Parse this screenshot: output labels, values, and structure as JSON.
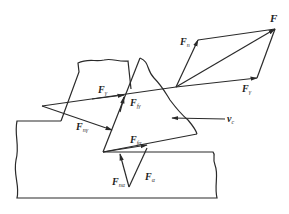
{
  "diagram": {
    "type": "cutting-force-diagram",
    "labels": {
      "F": "F",
      "F_n": {
        "main": "F",
        "sub": "n"
      },
      "F_gamma_right": {
        "main": "F",
        "sub": "γ"
      },
      "F_gamma": {
        "main": "F",
        "sub": "γ"
      },
      "F_fgamma": {
        "main": "F",
        "sub": "fγ"
      },
      "F_ngamma": {
        "main": "F",
        "sub": "nγ"
      },
      "F_falpha": {
        "main": "F",
        "sub": "fα"
      },
      "F_nalpha": {
        "main": "F",
        "sub": "nα"
      },
      "F_alpha": {
        "main": "F",
        "sub": "α"
      },
      "v_c": {
        "main": "v",
        "sub": "c"
      }
    },
    "colors": {
      "stroke": "#2a2a2a",
      "background": "#ffffff"
    }
  }
}
